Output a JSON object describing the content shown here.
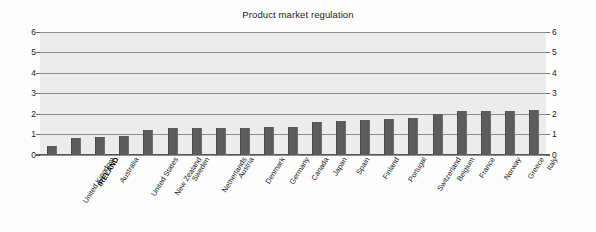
{
  "chart_data": {
    "type": "bar",
    "title": "Product market regulation",
    "xlabel": "",
    "ylabel": "",
    "ylim": [
      0,
      6
    ],
    "yticks": [
      0,
      1,
      2,
      3,
      4,
      5,
      6
    ],
    "grid": true,
    "legend": false,
    "dual_axis": true,
    "highlight_category": "IRELAND",
    "bar_color": "#5c5c5c",
    "plot_background": "#ececec",
    "categories": [
      "United Kingdom",
      "IRELAND",
      "Australia",
      "United States",
      "New Zealand",
      "Sweden",
      "Netherlands",
      "Austria",
      "Denmark",
      "Germany",
      "Canada",
      "Japan",
      "Spain",
      "Finland",
      "Portugal",
      "Switzerland",
      "Belgium",
      "France",
      "Norway",
      "Greece",
      "Italy"
    ],
    "values": [
      0.45,
      0.85,
      0.9,
      0.95,
      1.2,
      1.3,
      1.3,
      1.3,
      1.3,
      1.35,
      1.35,
      1.6,
      1.65,
      1.7,
      1.75,
      1.8,
      2.0,
      2.15,
      2.15,
      2.15,
      2.2
    ]
  },
  "axes": {
    "left_ticks": [
      "6",
      "5",
      "4",
      "3",
      "2",
      "1",
      "0"
    ],
    "right_ticks": [
      "6",
      "5",
      "4",
      "3",
      "2",
      "1",
      "0"
    ]
  }
}
